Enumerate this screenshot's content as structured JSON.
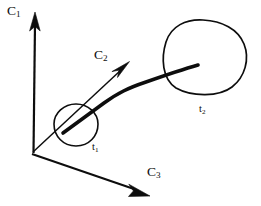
{
  "figure": {
    "kind": "3d-axis-trajectory-diagram",
    "background_color": "#ffffff",
    "ink_color": "#0d0d0d",
    "width": 261,
    "height": 206
  },
  "axes": {
    "origin": {
      "x": 31,
      "y": 153
    },
    "items": [
      {
        "id": "c1",
        "label_base": "C",
        "label_sub": "1",
        "direction": "up",
        "from": {
          "x": 31,
          "y": 153
        },
        "to": {
          "x": 35,
          "y": 14
        }
      },
      {
        "id": "c2",
        "label_base": "C",
        "label_sub": "2",
        "direction": "up-right-diagonal",
        "from": {
          "x": 31,
          "y": 153
        },
        "to": {
          "x": 129,
          "y": 61
        }
      },
      {
        "id": "c3",
        "label_base": "C",
        "label_sub": "3",
        "direction": "down-right",
        "from": {
          "x": 31,
          "y": 153
        },
        "to": {
          "x": 150,
          "y": 196
        }
      }
    ]
  },
  "regions": [
    {
      "id": "t1",
      "label_base": "t",
      "label_sub": "1",
      "shape": "small-ellipse",
      "center": {
        "x": 76,
        "y": 125
      },
      "radius_x": 23,
      "radius_y": 21
    },
    {
      "id": "t2",
      "label_base": "t",
      "label_sub": "2",
      "shape": "large-blob",
      "center": {
        "x": 204,
        "y": 58
      },
      "radius_x": 41,
      "radius_y": 38
    }
  ],
  "trajectory": {
    "id": "t1-to-t2-path",
    "description": "thick curved stroke from inside t1 region to inside t2 region",
    "start": {
      "x": 63,
      "y": 133
    },
    "end": {
      "x": 198,
      "y": 65
    },
    "stroke_width": 3.6
  }
}
